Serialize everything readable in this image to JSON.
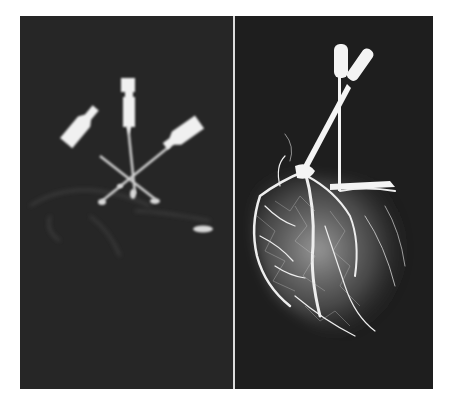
{
  "figure": {
    "panels": [
      {
        "id": "left",
        "subject": "radiograph with three cannula needles crossed, faint vessel outlines"
      },
      {
        "id": "right",
        "subject": "radiograph of injected coronary vasculature of a heart with two cannulas"
      }
    ],
    "colors": {
      "background": "#ffffff",
      "panel_dark": "#242424",
      "contrast_white": "#f2f2f2",
      "divider": "#dcdcdc"
    }
  }
}
